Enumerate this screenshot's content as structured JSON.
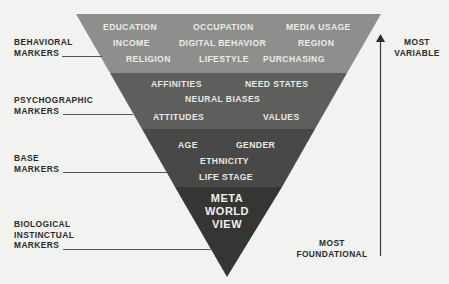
{
  "colors": {
    "background": "#f2f2f0",
    "band_behavioral": "#8e8e8c",
    "band_psychographic": "#5e5e5c",
    "band_base": "#484846",
    "band_core": "#353533",
    "label_text": "#2a2a2a",
    "band_text": "#e8e8e6",
    "arrow": "#3a3a3a"
  },
  "pyramid": {
    "orientation": "inverted",
    "layers": [
      {
        "name": "behavioral",
        "rows": [
          [
            "EDUCATION",
            "OCCUPATION",
            "MEDIA USAGE"
          ],
          [
            "INCOME",
            "DIGITAL BEHAVIOR",
            "REGION"
          ],
          [
            "RELIGION",
            "LIFESTYLE",
            "PURCHASING"
          ]
        ]
      },
      {
        "name": "psychographic",
        "rows": [
          [
            "AFFINITIES",
            "NEED STATES"
          ],
          [
            "NEURAL BIASES"
          ],
          [
            "ATTITUDES",
            "VALUES"
          ]
        ]
      },
      {
        "name": "base",
        "rows": [
          [
            "AGE",
            "GENDER"
          ],
          [
            "ETHNICITY"
          ],
          [
            "LIFE STAGE"
          ]
        ]
      },
      {
        "name": "core",
        "lines": [
          "META",
          "WORLD",
          "VIEW"
        ]
      }
    ]
  },
  "left_labels": {
    "behavioral": [
      "BEHAVIORAL",
      "MARKERS"
    ],
    "psychographic": [
      "PSYCHOGRAPHIC",
      "MARKERS"
    ],
    "base": [
      "BASE",
      "MARKERS"
    ],
    "biological": [
      "BIOLOGICAL",
      "INSTINCTUAL",
      "MARKERS"
    ]
  },
  "axis": {
    "top_label": [
      "MOST",
      "VARIABLE"
    ],
    "bottom_label": [
      "MOST",
      "FOUNDATIONAL"
    ],
    "direction": "up"
  }
}
